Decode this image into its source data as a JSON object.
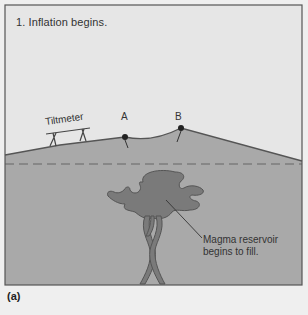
{
  "figure": {
    "step_title": "1. Inflation begins.",
    "instrument_label": "Tiltmeter",
    "points": [
      {
        "label": "A"
      },
      {
        "label": "B"
      }
    ],
    "callout": {
      "line1": "Magma reservoir",
      "line2": "begins to fill."
    },
    "panel_label": "(a)",
    "colors": {
      "sky": "#e6e6e6",
      "ground": "#a9a9a9",
      "magma": "#7a7a7a",
      "outline": "#555555",
      "frame": "#555555"
    }
  }
}
